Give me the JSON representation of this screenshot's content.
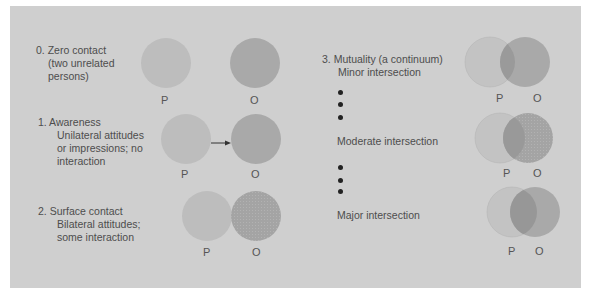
{
  "colors": {
    "background": "#ffffff",
    "panel": "#cfcfcf",
    "circle_p": "#bcbcbc",
    "circle_o": "#a9a9a9",
    "overlap": "#989898",
    "text": "#4d4d4d",
    "dot": "#222222"
  },
  "levels": [
    {
      "number": "0.",
      "title": "Zero contact",
      "details": [
        "(two unrelated",
        "persons)"
      ],
      "p_label": "P",
      "o_label": "O"
    },
    {
      "number": "1.",
      "title": "Awareness",
      "details": [
        "Unilateral attitudes",
        "or impressions; no",
        "interaction"
      ],
      "p_label": "P",
      "o_label": "O",
      "arrow": "P → O"
    },
    {
      "number": "2.",
      "title": "Surface contact",
      "details": [
        "Bilateral attitudes;",
        "some interaction"
      ],
      "p_label": "P",
      "o_label": "O"
    },
    {
      "number": "3.",
      "title": "Mutuality (a continuum)",
      "stages": [
        {
          "label": "Minor intersection",
          "p_label": "P",
          "o_label": "O"
        },
        {
          "label": "Moderate intersection",
          "p_label": "P",
          "o_label": "O"
        },
        {
          "label": "Major intersection",
          "p_label": "P",
          "o_label": "O"
        }
      ]
    }
  ]
}
